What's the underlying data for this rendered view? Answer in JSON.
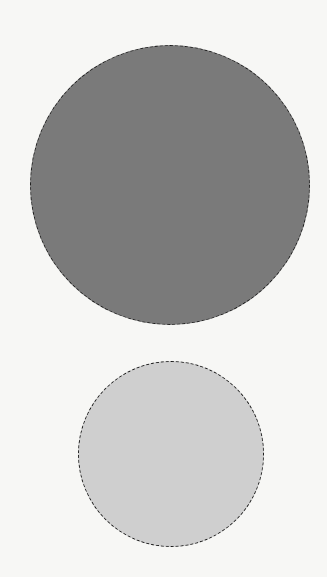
{
  "canvas": {
    "width": 327,
    "height": 577,
    "background": "#f7f7f5"
  },
  "shapes": [
    {
      "id": "large-circle",
      "type": "circle",
      "center_x": 170,
      "center_y": 185,
      "diameter": 280,
      "fill": "#7a7a7a",
      "stroke": "#1a1a1a",
      "stroke_style": "dashed"
    },
    {
      "id": "small-circle",
      "type": "circle",
      "center_x": 171,
      "center_y": 454,
      "diameter": 186,
      "fill": "#cfcfcf",
      "stroke": "#1a1a1a",
      "stroke_style": "dashed"
    }
  ]
}
